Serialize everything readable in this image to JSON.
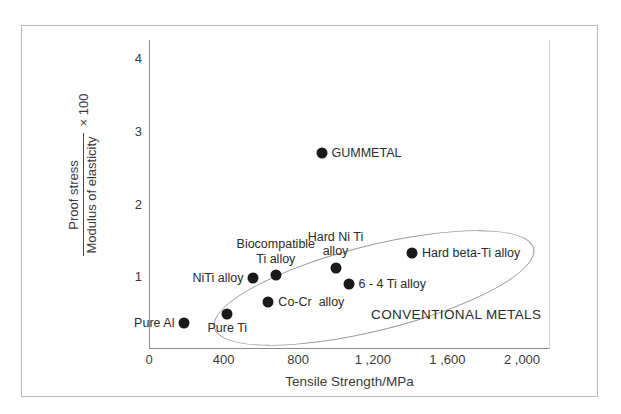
{
  "chart_data": {
    "type": "scatter",
    "title": "",
    "xlabel": "Tensile Strength/MPa",
    "ylabel_numerator": "Proof stress",
    "ylabel_denominator": "Modulus of elasticity",
    "ylabel_multiplier": "× 100",
    "xlim": [
      0,
      2150
    ],
    "ylim": [
      0,
      4.25
    ],
    "xticks": [
      0,
      400,
      800,
      1200,
      1600,
      2000
    ],
    "xticklabels": [
      "0",
      "400",
      "800",
      "1 ,200",
      "1 ,600",
      "2 ,000"
    ],
    "yticks": [
      1,
      2,
      3,
      4
    ],
    "yticklabels": [
      "1",
      "2",
      "3",
      "4"
    ],
    "grid": false,
    "legend": false,
    "points": [
      {
        "label": "GUMMETAL",
        "x": 925,
        "y": 2.7,
        "label_pos": "right"
      },
      {
        "label": "Hard beta-Ti alloy",
        "x": 1410,
        "y": 1.32,
        "label_pos": "right"
      },
      {
        "label": "Hard Ni Ti\nalloy",
        "x": 1000,
        "y": 1.12,
        "label_pos": "above"
      },
      {
        "label": "6 - 4 Ti alloy",
        "x": 1070,
        "y": 0.9,
        "label_pos": "right"
      },
      {
        "label": "Biocompatible\nTi alloy",
        "x": 680,
        "y": 1.02,
        "label_pos": "above"
      },
      {
        "label": "NiTi alloy",
        "x": 560,
        "y": 0.98,
        "label_pos": "left"
      },
      {
        "label": "Co-Cr  alloy",
        "x": 640,
        "y": 0.64,
        "label_pos": "right"
      },
      {
        "label": "Pure Ti",
        "x": 420,
        "y": 0.48,
        "label_pos": "below"
      },
      {
        "label": "Pure Al",
        "x": 190,
        "y": 0.36,
        "label_pos": "left"
      }
    ],
    "annotations": [
      {
        "name": "group-ellipse-label",
        "text": "CONVENTIONAL METALS"
      }
    ]
  }
}
